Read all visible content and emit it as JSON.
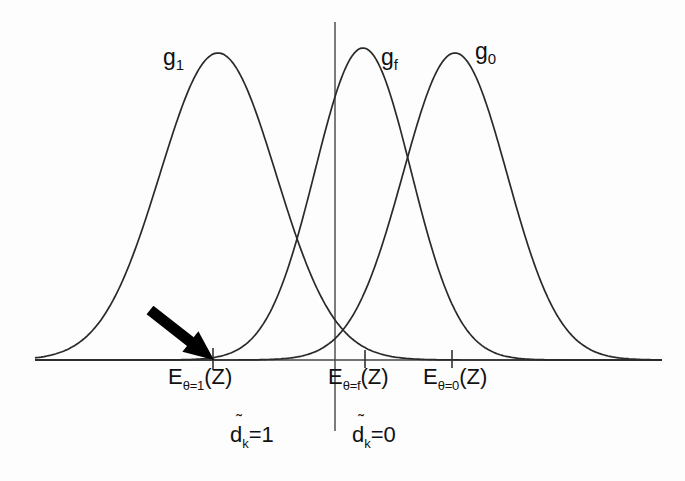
{
  "figure": {
    "background_color": "#fdfdfd",
    "line_color": "#2a2a2a",
    "arrow_color": "#000000"
  },
  "curve_labels": [
    {
      "base": "g",
      "sub": "1",
      "x": 163,
      "y": 46
    },
    {
      "base": "g",
      "sub": "f",
      "x": 381,
      "y": 46
    },
    {
      "base": "g",
      "sub": "0",
      "x": 475,
      "y": 40
    }
  ],
  "axis_tick_labels": [
    {
      "base": "E",
      "sub": "θ=1",
      "tail": "(Z)",
      "x": 168,
      "y": 366
    },
    {
      "base": "E",
      "sub": "θ=f",
      "tail": "(Z)",
      "x": 328,
      "y": 366
    },
    {
      "base": "E",
      "sub": "θ=0",
      "tail": "(Z)",
      "x": 423,
      "y": 366
    }
  ],
  "region_labels": [
    {
      "base": "d",
      "accent": "̃",
      "sub": "k",
      "tail": "=1",
      "x": 230,
      "y": 424
    },
    {
      "base": "d",
      "accent": "̃",
      "sub": "k",
      "tail": "=0",
      "x": 352,
      "y": 424
    }
  ],
  "chart_data": {
    "type": "line",
    "title": "",
    "xlabel": "",
    "ylabel": "",
    "grid": false,
    "legend": "inline-curve-labels",
    "baseline_y": 360,
    "x_axis": {
      "x_start": 35,
      "x_end": 662,
      "y": 360
    },
    "y_axis": {
      "x": 335,
      "y_top": 22,
      "y_bottom": 431
    },
    "ticks": [
      {
        "label": "E_theta=1(Z)",
        "x": 213,
        "height": 22
      },
      {
        "label": "E_theta=f(Z)",
        "x": 365,
        "height": 18
      },
      {
        "label": "E_theta=0(Z)",
        "x": 452,
        "height": 18
      }
    ],
    "series": [
      {
        "name": "g1",
        "mean_x": 218,
        "peak_y": 53,
        "sigma_px": 58,
        "amplitude_px": 307
      },
      {
        "name": "gf",
        "mean_x": 363,
        "peak_y": 48,
        "sigma_px": 48,
        "amplitude_px": 312
      },
      {
        "name": "g0",
        "mean_x": 455,
        "peak_y": 53,
        "sigma_px": 52,
        "amplitude_px": 307
      }
    ],
    "intersections": [
      {
        "between": [
          "g1",
          "gf"
        ],
        "x": 288,
        "y": 256
      },
      {
        "between": [
          "gf",
          "g0"
        ],
        "x": 410,
        "y": 152
      }
    ],
    "annotations": [
      {
        "type": "arrow",
        "name": "threshold-arrow",
        "from_x": 150,
        "from_y": 310,
        "to_x": 214,
        "to_y": 360,
        "points_to": "E_theta=1(Z)"
      }
    ]
  }
}
